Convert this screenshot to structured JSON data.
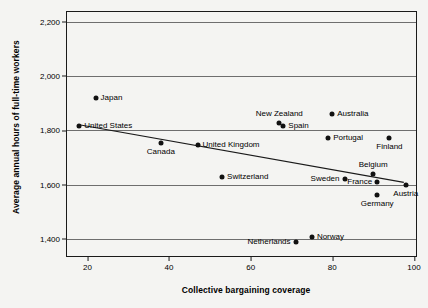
{
  "chart_data": {
    "type": "scatter",
    "title": "",
    "xlabel": "Collective bargaining coverage",
    "ylabel": "Average annual hours of full-time workers",
    "xlim": [
      15,
      101
    ],
    "ylim": [
      1330,
      2235
    ],
    "xticks": [
      20,
      40,
      60,
      80,
      100
    ],
    "xtick_labels": [
      "20",
      "40",
      "60",
      "80",
      "100"
    ],
    "yticks": [
      1400,
      1600,
      1800,
      2000,
      2200
    ],
    "ytick_labels": [
      "1,400",
      "1,600",
      "1,800",
      "2,000",
      "2,200"
    ],
    "grid": "horizontal",
    "legend": "none",
    "point_color": "#111111",
    "trendline": {
      "label": "fitted regression line",
      "x": [
        18,
        98
      ],
      "y": [
        1817,
        1603
      ]
    },
    "points": [
      {
        "label": "United States",
        "x": 18,
        "y": 1817,
        "label_pos": "right"
      },
      {
        "label": "Japan",
        "x": 22,
        "y": 1920,
        "label_pos": "right"
      },
      {
        "label": "Canada",
        "x": 38,
        "y": 1752,
        "label_pos": "below"
      },
      {
        "label": "United Kingdom",
        "x": 47,
        "y": 1744,
        "label_pos": "right"
      },
      {
        "label": "Switzerland",
        "x": 53,
        "y": 1628,
        "label_pos": "right"
      },
      {
        "label": "New Zealand",
        "x": 67,
        "y": 1827,
        "label_pos": "above"
      },
      {
        "label": "Spain",
        "x": 68,
        "y": 1817,
        "label_pos": "right"
      },
      {
        "label": "Netherlands",
        "x": 71,
        "y": 1388,
        "label_pos": "left"
      },
      {
        "label": "Norway",
        "x": 75,
        "y": 1408,
        "label_pos": "right"
      },
      {
        "label": "Portugal",
        "x": 79,
        "y": 1770,
        "label_pos": "right"
      },
      {
        "label": "Australia",
        "x": 80,
        "y": 1858,
        "label_pos": "right"
      },
      {
        "label": "Sweden",
        "x": 83,
        "y": 1620,
        "label_pos": "left"
      },
      {
        "label": "Belgium",
        "x": 90,
        "y": 1638,
        "label_pos": "above"
      },
      {
        "label": "France",
        "x": 91,
        "y": 1608,
        "label_pos": "left"
      },
      {
        "label": "Germany",
        "x": 91,
        "y": 1563,
        "label_pos": "below"
      },
      {
        "label": "Finland",
        "x": 94,
        "y": 1772,
        "label_pos": "below"
      },
      {
        "label": "Austria",
        "x": 98,
        "y": 1598,
        "label_pos": "below"
      }
    ]
  }
}
